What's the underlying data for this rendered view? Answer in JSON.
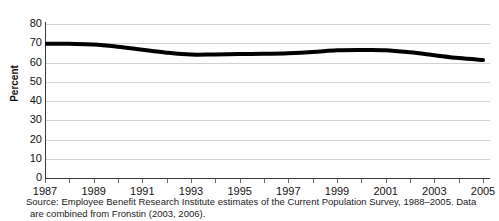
{
  "chart_data": {
    "type": "line",
    "title": "",
    "xlabel": "",
    "ylabel": "Percent",
    "ylim": [
      0,
      80
    ],
    "xlim": [
      1987,
      2005
    ],
    "ytick_step": 10,
    "grid": true,
    "legend": "none",
    "line_color": "#000000",
    "grid_color": "#d2d2d2",
    "axis_color": "#3a3a3a",
    "ytick_labels": [
      "80",
      "70",
      "60",
      "50",
      "40",
      "30",
      "20",
      "10",
      "0"
    ],
    "ytick_values": [
      80,
      70,
      60,
      50,
      40,
      30,
      20,
      10,
      0
    ],
    "xtick_labels": [
      "1987",
      "1989",
      "1991",
      "1993",
      "1995",
      "1997",
      "1999",
      "2001",
      "2003",
      "2005"
    ],
    "xtick_values": [
      1987,
      1989,
      1991,
      1993,
      1995,
      1997,
      1999,
      2001,
      2003,
      2005
    ],
    "x": [
      1987,
      1988,
      1989,
      1990,
      1991,
      1992,
      1993,
      1994,
      1995,
      1996,
      1997,
      1998,
      1999,
      2000,
      2001,
      2002,
      2003,
      2004,
      2005
    ],
    "values": [
      69.8,
      69.7,
      69.4,
      68.2,
      66.6,
      65.1,
      64.1,
      64.2,
      64.4,
      64.5,
      64.8,
      65.4,
      66.3,
      66.5,
      66.4,
      65.3,
      63.8,
      62.3,
      61.3
    ],
    "series": [
      {
        "name": "Percent with employment-based health coverage",
        "values": [
          69.8,
          69.7,
          69.4,
          68.2,
          66.6,
          65.1,
          64.1,
          64.2,
          64.4,
          64.5,
          64.8,
          65.4,
          66.3,
          66.5,
          66.4,
          65.3,
          63.8,
          62.3,
          61.3
        ]
      }
    ]
  },
  "source_note": "Source: Employee Benefit Research Institute estimates of the Current Population Survey, 1988–2005. Data are combined from Fronstin (2003, 2006).",
  "title_sliver": ""
}
